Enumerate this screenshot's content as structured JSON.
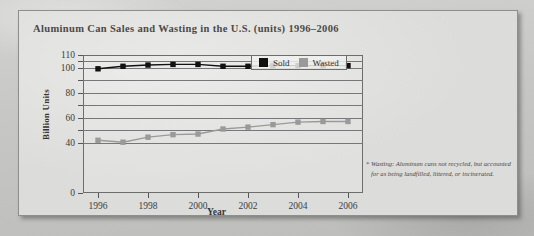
{
  "figure": {
    "title": "Aluminum Can Sales and Wasting in the U.S. (units) 1996–2006",
    "footnote_marker": "*",
    "footnote": "Wasting: Aluminum cans not recycled, but accounted for as being landfilled, littered, or incinerated."
  },
  "legend": {
    "position": "top-right-inside",
    "items": [
      {
        "label": "Sold",
        "color": "#111111"
      },
      {
        "label": "Wasted",
        "color": "#9a9a9a"
      }
    ]
  },
  "chart_data": {
    "type": "line",
    "title": "Aluminum Can Sales and Wasting in the U.S. (units) 1996–2006",
    "xlabel": "Year",
    "ylabel": "Billion Units",
    "x": [
      1996,
      1997,
      1998,
      1999,
      2000,
      2001,
      2002,
      2003,
      2004,
      2005,
      2006
    ],
    "xtick_labels": [
      "1996",
      "1998",
      "2000",
      "2002",
      "2004",
      "2006"
    ],
    "xtick_values": [
      1996,
      1998,
      2000,
      2002,
      2004,
      2006
    ],
    "xlim": [
      1995.4,
      2006.6
    ],
    "ylim": [
      0,
      110
    ],
    "ytick_values": [
      0,
      40,
      50,
      60,
      70,
      80,
      90,
      100,
      105,
      110
    ],
    "ytick_labels": [
      "0",
      "40",
      "",
      "60",
      "",
      "80",
      "",
      "100",
      "",
      "110"
    ],
    "grid": true,
    "grid_axis": "y",
    "series": [
      {
        "name": "Sold",
        "color": "#111111",
        "marker": "square",
        "values": [
          99,
          101,
          102,
          102.5,
          102.5,
          101,
          101,
          101.5,
          101.5,
          101.5,
          101.5
        ]
      },
      {
        "name": "Wasted",
        "color": "#9a9a9a",
        "marker": "square",
        "values": [
          42,
          40.5,
          44.5,
          46.5,
          47,
          51,
          52.5,
          54.5,
          56.5,
          57,
          57
        ]
      }
    ]
  }
}
